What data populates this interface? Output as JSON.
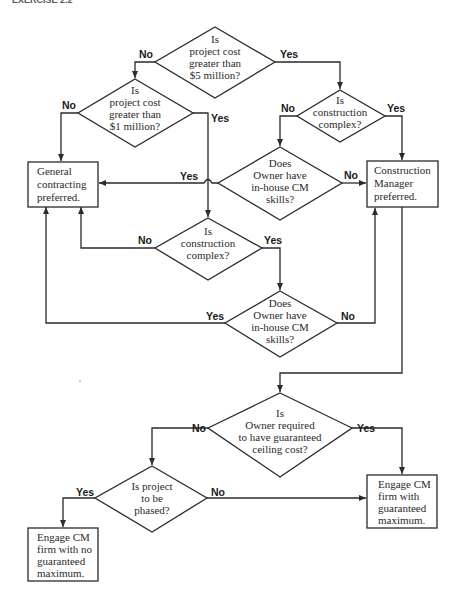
{
  "header": {
    "text": "EXERCISE 2.2"
  },
  "decisions": [
    {
      "id": "d1",
      "lines": [
        "Is",
        "project cost",
        "greater than",
        "$5 million?"
      ]
    },
    {
      "id": "d2",
      "lines": [
        "Is",
        "project cost",
        "greater than",
        "$1 million?"
      ]
    },
    {
      "id": "d3",
      "lines": [
        "Is",
        "construction",
        "complex?"
      ]
    },
    {
      "id": "d4",
      "lines": [
        "Does",
        "Owner have",
        "in-house CM",
        "skills?"
      ]
    },
    {
      "id": "d5",
      "lines": [
        "Is",
        "construction",
        "complex?"
      ]
    },
    {
      "id": "d6",
      "lines": [
        "Does",
        "Owner have",
        "in-house CM",
        "skills?"
      ]
    },
    {
      "id": "d7",
      "lines": [
        "Is",
        "Owner required",
        "to have guaranteed",
        "ceiling cost?"
      ]
    },
    {
      "id": "d8",
      "lines": [
        "Is project",
        "to be",
        "phased?"
      ]
    }
  ],
  "outcomes": [
    {
      "id": "gc",
      "lines": [
        "General",
        "contracting",
        "preferred."
      ]
    },
    {
      "id": "cm",
      "lines": [
        "Construction",
        "Manager",
        "preferred."
      ]
    },
    {
      "id": "gmax",
      "lines": [
        "Engage CM",
        "firm with",
        "guaranteed",
        "maximum."
      ]
    },
    {
      "id": "nogmax",
      "lines": [
        "Engage CM",
        "firm with no",
        "guaranteed",
        "maximum."
      ]
    }
  ],
  "edge_labels": {
    "d1_no": "No",
    "d1_yes": "Yes",
    "d2_no": "No",
    "d2_yes": "Yes",
    "d3_no": "No",
    "d3_yes": "Yes",
    "d4_yes": "Yes",
    "d4_no": "No",
    "d5_no": "No",
    "d5_yes": "Yes",
    "d6_yes": "Yes",
    "d6_no": "No",
    "d7_no": "No",
    "d7_yes": "Yes",
    "d8_yes": "Yes",
    "d8_no": "No"
  }
}
